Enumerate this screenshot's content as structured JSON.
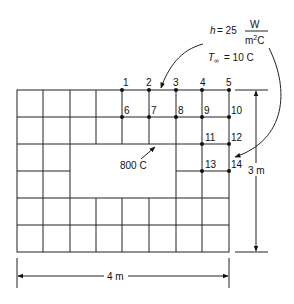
{
  "diagram": {
    "type": "finite-difference-grid",
    "convection": {
      "h_symbol": "h",
      "h_value": "= 25",
      "h_units_num": "W",
      "h_units_den": "m",
      "h_units_den_exp": "2",
      "h_units_den_suffix": "C",
      "t_symbol": "T",
      "t_subscript": "∞",
      "t_value": "= 10 C"
    },
    "interior_temperature": "800 C",
    "dimensions": {
      "width": "4 m",
      "height": "3 m"
    },
    "nodes": [
      {
        "id": "1",
        "label": "1"
      },
      {
        "id": "2",
        "label": "2"
      },
      {
        "id": "3",
        "label": "3"
      },
      {
        "id": "4",
        "label": "4"
      },
      {
        "id": "5",
        "label": "5"
      },
      {
        "id": "6",
        "label": "6"
      },
      {
        "id": "7",
        "label": "7"
      },
      {
        "id": "8",
        "label": "8"
      },
      {
        "id": "9",
        "label": "9"
      },
      {
        "id": "10",
        "label": "10"
      },
      {
        "id": "11",
        "label": "11"
      },
      {
        "id": "12",
        "label": "12"
      },
      {
        "id": "13",
        "label": "13"
      },
      {
        "id": "14",
        "label": "14"
      }
    ]
  }
}
